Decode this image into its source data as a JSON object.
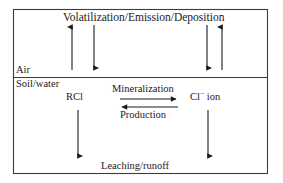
{
  "diagram": {
    "title_label": "Volatilization/Emission/Deposition",
    "compartments": {
      "upper_label": "Air",
      "lower_label": "Soil/water"
    },
    "species": {
      "left": "RCl",
      "right_base": "Cl",
      "right_charge": "−",
      "right_suffix": " ion"
    },
    "processes": {
      "forward": "Mineralization",
      "reverse": "Production",
      "bottom": "Leaching/runoff"
    },
    "colors": {
      "line": "#1a1a1a",
      "border": "#3c3c3c",
      "background": "#ffffff"
    },
    "arrows": [
      {
        "name": "air-up-left",
        "direction": "up",
        "x": 72,
        "y1": 70,
        "y2": 25
      },
      {
        "name": "air-down-left",
        "direction": "down",
        "x": 94,
        "y1": 25,
        "y2": 70
      },
      {
        "name": "air-down-right",
        "direction": "down",
        "x": 207,
        "y1": 25,
        "y2": 70
      },
      {
        "name": "air-up-right",
        "direction": "up",
        "x": 222,
        "y1": 70,
        "y2": 25
      },
      {
        "name": "mineralization",
        "direction": "right",
        "y": 99,
        "x1": 120,
        "x2": 178
      },
      {
        "name": "production",
        "direction": "left",
        "y": 107,
        "x1": 178,
        "x2": 120
      },
      {
        "name": "rcl-leaching",
        "direction": "down",
        "x": 78,
        "y1": 110,
        "y2": 158
      },
      {
        "name": "clion-leaching",
        "direction": "down",
        "x": 208,
        "y1": 110,
        "y2": 158
      }
    ],
    "frame": {
      "x": 13,
      "y": 9,
      "width": 255,
      "height": 165,
      "divider_y": 77
    }
  }
}
